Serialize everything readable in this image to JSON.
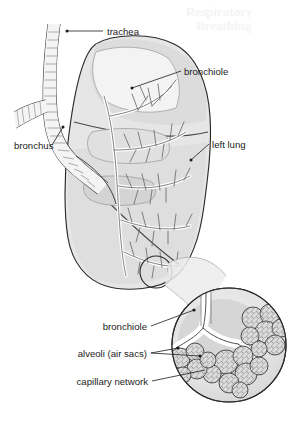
{
  "figure": {
    "background_color": "#ffffff",
    "line_color": "#1c1c1c",
    "fills": {
      "lung_body": "#e4e4e4",
      "lung_shade": "#cfcfcf",
      "lung_dark": "#bdbdbd",
      "airway": "#f2f2f2",
      "inset_outer": "#e8e8e8",
      "inset_inner": "#d2d2d2",
      "alveoli": "#d8d8d8"
    }
  },
  "labels": {
    "trachea": "trachea",
    "bronchiole_upper": "bronchiole",
    "bronchus": "bronchus",
    "left_lung": "left lung",
    "bronchiole_inset": "bronchiole",
    "alveoli": "alveoli (air sacs)",
    "capillary_network": "capillary network"
  },
  "ghost_text": {
    "line1": "Respiratory",
    "line2": "Breathing"
  }
}
